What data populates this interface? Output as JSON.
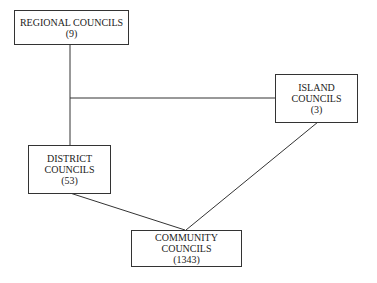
{
  "nodes": {
    "regional": {
      "lines": [
        "REGIONAL COUNCILS",
        "(9)"
      ]
    },
    "island": {
      "lines": [
        "ISLAND",
        "COUNCILS",
        "(3)"
      ]
    },
    "district": {
      "lines": [
        "DISTRICT",
        "COUNCILS",
        "(53)"
      ]
    },
    "community": {
      "lines": [
        "COMMUNITY",
        "COUNCILS",
        "(1343)"
      ]
    }
  },
  "edges": [
    {
      "from": "regional",
      "to": "district"
    },
    {
      "from": "regional-district-trunk",
      "to": "island"
    },
    {
      "from": "district",
      "to": "community"
    },
    {
      "from": "island",
      "to": "community"
    }
  ]
}
